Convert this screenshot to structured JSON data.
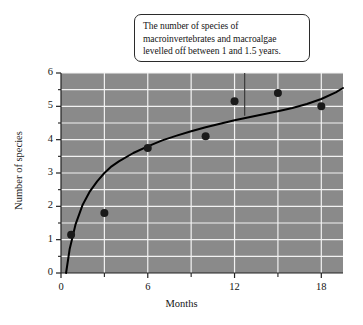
{
  "chart_data": {
    "type": "scatter",
    "title": "",
    "xlabel": "Months",
    "ylabel": "Number of species",
    "xlim": [
      0,
      19.5
    ],
    "ylim": [
      0,
      6
    ],
    "xticks": [
      0,
      6,
      12,
      18
    ],
    "xtick_labels": [
      "0",
      "6",
      "12",
      "18"
    ],
    "xminor_ticks": [
      3,
      9,
      15
    ],
    "yticks": [
      0,
      1,
      2,
      3,
      4,
      5,
      6
    ],
    "ytick_labels": [
      "0",
      "1",
      "2",
      "3",
      "4",
      "5",
      "6"
    ],
    "yminor_ticks": [
      0.5,
      1.5,
      2.5,
      3.5,
      4.5,
      5.5
    ],
    "grid": true,
    "grid_color": "#f2f2f2",
    "plot_background": "#8a8a8a",
    "legend": null,
    "points": [
      {
        "x": 0.7,
        "y": 1.15
      },
      {
        "x": 3.0,
        "y": 1.8
      },
      {
        "x": 6.0,
        "y": 3.75
      },
      {
        "x": 10.0,
        "y": 4.1
      },
      {
        "x": 12.0,
        "y": 5.15
      },
      {
        "x": 15.0,
        "y": 5.4
      },
      {
        "x": 18.0,
        "y": 5.0
      }
    ],
    "point_color": "#1a1a1a",
    "point_radius": 4.0,
    "fit_curve": {
      "kind": "logarithmic",
      "color": "#000000",
      "width": 2.0,
      "x_start": 0.35,
      "x_end": 19.5,
      "samples": [
        {
          "x": 0.35,
          "y": 0.0
        },
        {
          "x": 0.6,
          "y": 0.72
        },
        {
          "x": 1.0,
          "y": 1.45
        },
        {
          "x": 1.5,
          "y": 2.05
        },
        {
          "x": 2.0,
          "y": 2.45
        },
        {
          "x": 2.5,
          "y": 2.75
        },
        {
          "x": 3.0,
          "y": 3.0
        },
        {
          "x": 3.5,
          "y": 3.2
        },
        {
          "x": 4.0,
          "y": 3.35
        },
        {
          "x": 5.0,
          "y": 3.6
        },
        {
          "x": 6.0,
          "y": 3.8
        },
        {
          "x": 7.0,
          "y": 3.98
        },
        {
          "x": 8.0,
          "y": 4.12
        },
        {
          "x": 9.0,
          "y": 4.25
        },
        {
          "x": 10.0,
          "y": 4.37
        },
        {
          "x": 11.0,
          "y": 4.48
        },
        {
          "x": 12.0,
          "y": 4.58
        },
        {
          "x": 13.0,
          "y": 4.67
        },
        {
          "x": 14.0,
          "y": 4.76
        },
        {
          "x": 15.0,
          "y": 4.85
        },
        {
          "x": 16.0,
          "y": 4.95
        },
        {
          "x": 17.0,
          "y": 5.07
        },
        {
          "x": 18.0,
          "y": 5.22
        },
        {
          "x": 19.0,
          "y": 5.42
        },
        {
          "x": 19.5,
          "y": 5.55
        }
      ]
    },
    "annotation": {
      "text": "The number of species of\nmacroinvertebrates and macroalgae\nlevelled off between 1 and 1.5 years.",
      "leader_from": {
        "x": 12.7,
        "y": 6.0
      },
      "leader_to": {
        "x": 12.7,
        "y": 4.72
      }
    }
  }
}
